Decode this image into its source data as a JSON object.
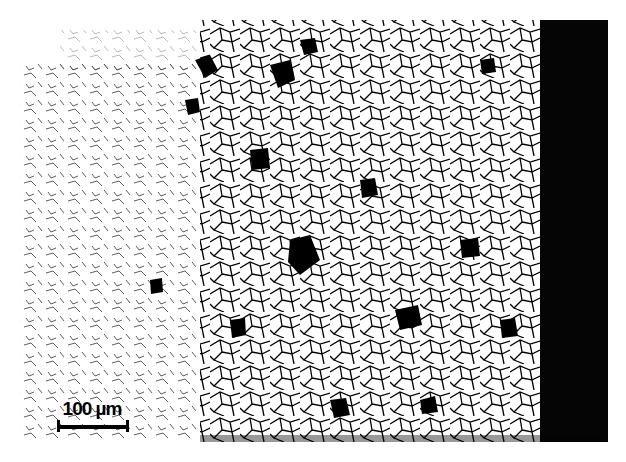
{
  "image": {
    "subject": "optical micrograph of etched polycrystalline metal showing grain structure",
    "colors": {
      "background": "#ffffff",
      "grain_boundary": "#000000",
      "dark_band": "#050505"
    }
  },
  "scale_bar": {
    "label": "100 µm"
  },
  "dark_region": {
    "x": 540,
    "y": 20,
    "width": 68,
    "height": 422
  }
}
